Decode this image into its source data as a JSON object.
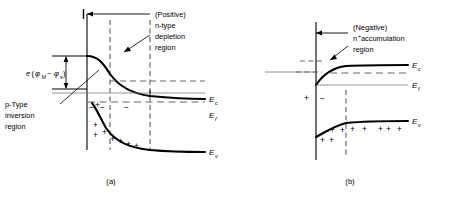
{
  "figure": {
    "panels": [
      {
        "id": "a",
        "caption": "(a)",
        "annotations": {
          "bias_sign": "(Positive)",
          "region_line1": "n-type",
          "region_line2": "depletion",
          "region_line3": "region",
          "inversion_line1": "p-Type",
          "inversion_line2": "inversion",
          "inversion_line3": "region",
          "barrier_e": "e",
          "barrier_open": "(",
          "barrier_phi1": "φ",
          "barrier_phi1_sub": "M",
          "barrier_minus": "−",
          "barrier_phi2": "φ",
          "barrier_phi2_sub": "s",
          "barrier_close": ")"
        },
        "energy_levels": [
          {
            "symbol": "E",
            "sub": "c",
            "name": "conduction-band-edge"
          },
          {
            "symbol": "E",
            "sub": "f",
            "name": "fermi-level"
          },
          {
            "symbol": "E",
            "sub": "v",
            "name": "valence-band-edge"
          }
        ],
        "charges": {
          "negative_symbol": "−",
          "positive_symbol": "+",
          "negative_count": 3,
          "positive_count": 8
        }
      },
      {
        "id": "b",
        "caption": "(b)",
        "annotations": {
          "bias_sign": "(Negative)",
          "region_line1_n": "n",
          "region_line1_sup": "+",
          "region_line1_rest": " accumulation",
          "region_line2": "region"
        },
        "energy_levels": [
          {
            "symbol": "E",
            "sub": "c",
            "name": "conduction-band-edge"
          },
          {
            "symbol": "E",
            "sub": "f",
            "name": "fermi-level"
          },
          {
            "symbol": "E",
            "sub": "v",
            "name": "valence-band-edge"
          }
        ],
        "charges": {
          "negative_symbol": "−",
          "positive_symbol": "+",
          "negative_count": 1,
          "positive_count": 11
        }
      }
    ],
    "colors": {
      "ink": "#000000",
      "background": "#ffffff",
      "dashed": "#555555"
    }
  }
}
